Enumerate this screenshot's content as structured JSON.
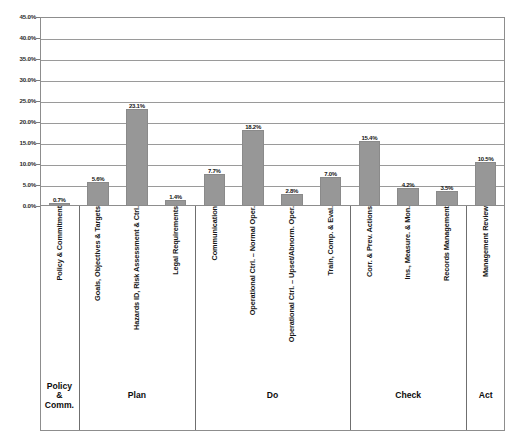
{
  "chart_data": {
    "type": "bar",
    "title": "",
    "xlabel": "",
    "ylabel": "",
    "ylim": [
      0,
      45
    ],
    "grid": true,
    "legend": "none",
    "orientation": "vertical",
    "bar_color": "#979797",
    "categories": [
      "Policy & Commitment",
      "Goals, Objectives & Targets",
      "Hazards ID, Risk Assessment & Ctrl.",
      "Legal Requirements",
      "Communication",
      "Operational Ctrl. – Normal Oper.",
      "Operational Ctrl. – Upset/Abnorm. Oper.",
      "Train, Comp. & Eval.",
      "Corr. & Prev. Actions",
      "Ins., Measure. & Mon.",
      "Records Management",
      "Management Review"
    ],
    "values": [
      0.7,
      5.6,
      23.1,
      1.4,
      7.7,
      18.2,
      2.8,
      7.0,
      15.4,
      4.2,
      3.5,
      10.5
    ],
    "value_labels": [
      "0.7%",
      "5.6%",
      "23.1%",
      "1.4%",
      "7.7%",
      "18.2%",
      "2.8%",
      "7.0%",
      "15.4%",
      "4.2%",
      "3.5%",
      "10.5%"
    ],
    "ytick_labels": [
      "45.0%",
      "40.0%",
      "35.0%",
      "30.0%",
      "25.0%",
      "20.0%",
      "15.0%",
      "10.0%",
      "5.0%",
      "0.0%"
    ],
    "ytick_values": [
      45,
      40,
      35,
      30,
      25,
      20,
      15,
      10,
      5,
      0
    ],
    "groups": [
      {
        "label": "Policy\n&\nComm.",
        "start": 0,
        "count": 1
      },
      {
        "label": "Plan",
        "start": 1,
        "count": 3
      },
      {
        "label": "Do",
        "start": 4,
        "count": 4
      },
      {
        "label": "Check",
        "start": 8,
        "count": 3
      },
      {
        "label": "Act",
        "start": 11,
        "count": 1
      }
    ]
  }
}
